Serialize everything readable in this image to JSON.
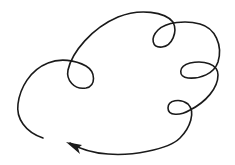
{
  "diagram": {
    "type": "looping-curve-with-arrow",
    "stroke_color": "#1a1a1a",
    "background": "#ffffff",
    "loops": [
      {
        "name": "left-loop",
        "center": [
          82,
          74
        ]
      },
      {
        "name": "top-right-loop",
        "center": [
          163,
          37
        ]
      },
      {
        "name": "right-loop",
        "center": [
          195,
          71
        ]
      },
      {
        "name": "lower-right-loop",
        "center": [
          178,
          110
        ]
      }
    ],
    "start_point": [
      43,
      138
    ],
    "arrow_tip": [
      67,
      142
    ],
    "arrow_direction": "left"
  }
}
